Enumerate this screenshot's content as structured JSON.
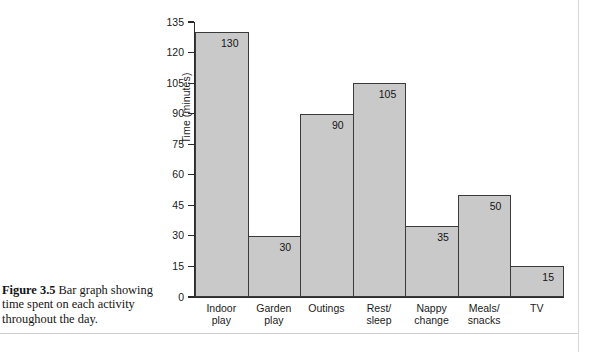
{
  "figure": {
    "label": "Figure 3.5",
    "caption": " Bar graph showing time spent on each activity throughout the day."
  },
  "chart_data": {
    "type": "bar",
    "title": "",
    "xlabel": "",
    "ylabel": "Time (minutes)",
    "categories": [
      "Indoor play",
      "Garden play",
      "Outings",
      "Rest/ sleep",
      "Nappy change",
      "Meals/ snacks",
      "TV"
    ],
    "category_lines": [
      [
        "Indoor",
        "play"
      ],
      [
        "Garden",
        "play"
      ],
      [
        "Outings",
        ""
      ],
      [
        "Rest/",
        "sleep"
      ],
      [
        "Nappy",
        "change"
      ],
      [
        "Meals/",
        "snacks"
      ],
      [
        "TV",
        ""
      ]
    ],
    "values": [
      130,
      30,
      90,
      105,
      35,
      50,
      15
    ],
    "value_labels": [
      "130",
      "30",
      "90",
      "105",
      "35",
      "50",
      "15"
    ],
    "ylim": [
      0,
      135
    ],
    "yticks": [
      0,
      15,
      30,
      45,
      60,
      75,
      90,
      105,
      120,
      135
    ],
    "ytick_labels": [
      "0",
      "15",
      "30",
      "45",
      "60",
      "75",
      "90",
      "105",
      "120",
      "135"
    ],
    "grid": false,
    "legend": null,
    "bar_color": "#c9c9c9",
    "bar_edge_color": "#3a3a3a",
    "axis_color": "#2b2b2b"
  }
}
